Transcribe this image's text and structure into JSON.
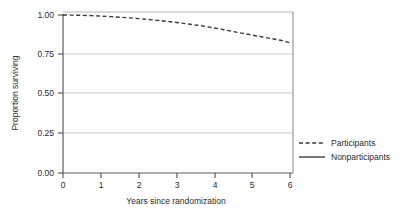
{
  "chart_data": {
    "type": "line",
    "title": "",
    "subtitle": "",
    "xlabel": "Years since randomization",
    "ylabel": "Proportion surviving",
    "xlim": [
      0,
      6
    ],
    "ylim": [
      0,
      1
    ],
    "xticks": [
      "0",
      "1",
      "2",
      "3",
      "4",
      "5",
      "6"
    ],
    "xtick_values": [
      0,
      1,
      2,
      3,
      4,
      5,
      6
    ],
    "yticks": [
      "0.00",
      "0.25",
      "0.50",
      "0.75",
      "1.00"
    ],
    "ytick_values": [
      0,
      0.25,
      0.5,
      0.75,
      1
    ],
    "grid": "horizontal",
    "legend_position": "right",
    "series": [
      {
        "name": "Participants",
        "style": "dashed",
        "color": "#3a3a3a",
        "x": [
          0,
          0.25,
          0.5,
          0.75,
          1,
          1.25,
          1.5,
          1.75,
          2,
          2.25,
          2.5,
          2.75,
          3,
          3.25,
          3.5,
          3.75,
          4,
          4.25,
          4.5,
          4.75,
          5,
          5.25,
          5.5,
          5.75,
          6
        ],
        "values": [
          1.0,
          0.999,
          0.998,
          0.996,
          0.993,
          0.99,
          0.986,
          0.982,
          0.977,
          0.972,
          0.966,
          0.96,
          0.953,
          0.945,
          0.937,
          0.928,
          0.918,
          0.907,
          0.895,
          0.884,
          0.873,
          0.862,
          0.851,
          0.84,
          0.824
        ]
      },
      {
        "name": "Nonparticipants",
        "style": "solid",
        "color": "#3a3a3a",
        "x": [],
        "values": []
      }
    ],
    "legend": [
      {
        "label": "Participants",
        "style": "dashed"
      },
      {
        "label": "Nonparticipants",
        "style": "solid"
      }
    ],
    "colors": {
      "axis": "#555555",
      "grid": "#cccccc",
      "line": "#3a3a3a",
      "background": "#ffffff",
      "text": "#2b2b2b"
    }
  }
}
